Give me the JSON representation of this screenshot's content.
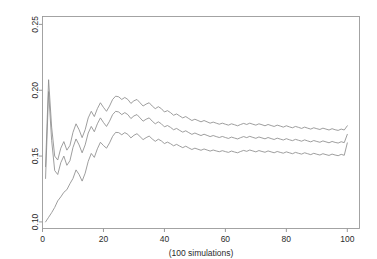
{
  "chart_data": {
    "type": "line",
    "title": "",
    "subtitle": "",
    "xlabel": "(100 simulations)",
    "ylabel": "",
    "xlim": [
      0,
      104
    ],
    "ylim": [
      0.095,
      0.256
    ],
    "xticks": [
      0,
      20,
      40,
      60,
      80,
      100
    ],
    "xtick_labels": [
      "0",
      "20",
      "40",
      "60",
      "80",
      "100"
    ],
    "yticks": [
      0.1,
      0.15,
      0.2,
      0.25
    ],
    "ytick_labels": [
      "0.10",
      "0.15",
      "0.20",
      "0.25"
    ],
    "ytick_rotation_deg": 90,
    "grid": false,
    "legend": "none",
    "line_color": "#8c8c8c",
    "frame_color": "#9a9a9a",
    "x": [
      1,
      2,
      3,
      4,
      5,
      6,
      7,
      8,
      9,
      10,
      11,
      12,
      13,
      14,
      15,
      16,
      17,
      18,
      19,
      20,
      21,
      22,
      23,
      24,
      25,
      26,
      27,
      28,
      29,
      30,
      31,
      32,
      33,
      34,
      35,
      36,
      37,
      38,
      39,
      40,
      41,
      42,
      43,
      44,
      45,
      46,
      47,
      48,
      49,
      50,
      51,
      52,
      53,
      54,
      55,
      56,
      57,
      58,
      59,
      60,
      61,
      62,
      63,
      64,
      65,
      66,
      67,
      68,
      69,
      70,
      71,
      72,
      73,
      74,
      75,
      76,
      77,
      78,
      79,
      80,
      81,
      82,
      83,
      84,
      85,
      86,
      87,
      88,
      89,
      90,
      91,
      92,
      93,
      94,
      95,
      96,
      97,
      98,
      99,
      100
    ],
    "series": [
      {
        "name": "upper confidence bound",
        "values": [
          0.142,
          0.208,
          0.172,
          0.15,
          0.147,
          0.156,
          0.161,
          0.1545,
          0.158,
          0.168,
          0.1745,
          0.17,
          0.164,
          0.17,
          0.179,
          0.184,
          0.18,
          0.186,
          0.1905,
          0.187,
          0.184,
          0.188,
          0.193,
          0.1955,
          0.195,
          0.193,
          0.1945,
          0.193,
          0.19,
          0.192,
          0.193,
          0.1905,
          0.188,
          0.1895,
          0.1905,
          0.188,
          0.186,
          0.1875,
          0.186,
          0.1835,
          0.1845,
          0.183,
          0.181,
          0.182,
          0.1805,
          0.179,
          0.18,
          0.1785,
          0.177,
          0.178,
          0.177,
          0.176,
          0.177,
          0.176,
          0.175,
          0.1758,
          0.175,
          0.1742,
          0.175,
          0.1742,
          0.1735,
          0.1745,
          0.1738,
          0.173,
          0.174,
          0.1748,
          0.174,
          0.175,
          0.1742,
          0.1735,
          0.1745,
          0.1738,
          0.173,
          0.174,
          0.1732,
          0.1725,
          0.1735,
          0.1728,
          0.172,
          0.173,
          0.1722,
          0.1715,
          0.1725,
          0.1718,
          0.171,
          0.172,
          0.1712,
          0.1705,
          0.1715,
          0.1708,
          0.1702,
          0.1712,
          0.1705,
          0.1698,
          0.1708,
          0.17,
          0.1695,
          0.1705,
          0.1698,
          0.173
        ]
      },
      {
        "name": "mean",
        "values": [
          0.133,
          0.199,
          0.162,
          0.139,
          0.136,
          0.145,
          0.15,
          0.143,
          0.1465,
          0.1565,
          0.163,
          0.1585,
          0.1525,
          0.1585,
          0.1675,
          0.1725,
          0.1685,
          0.1745,
          0.179,
          0.1755,
          0.1725,
          0.1765,
          0.1815,
          0.184,
          0.1835,
          0.1815,
          0.183,
          0.1815,
          0.1785,
          0.1805,
          0.1815,
          0.179,
          0.1765,
          0.178,
          0.179,
          0.1765,
          0.1745,
          0.176,
          0.1745,
          0.1722,
          0.1732,
          0.1718,
          0.17,
          0.171,
          0.1695,
          0.1682,
          0.1692,
          0.1678,
          0.1665,
          0.1675,
          0.1665,
          0.1656,
          0.1666,
          0.1657,
          0.1648,
          0.1656,
          0.1648,
          0.1641,
          0.1649,
          0.1641,
          0.1634,
          0.1644,
          0.1637,
          0.163,
          0.164,
          0.1648,
          0.164,
          0.165,
          0.1642,
          0.1635,
          0.1645,
          0.1638,
          0.1631,
          0.1641,
          0.1633,
          0.1626,
          0.1636,
          0.1629,
          0.1622,
          0.1632,
          0.1624,
          0.1617,
          0.1627,
          0.162,
          0.1613,
          0.1623,
          0.1615,
          0.1608,
          0.1618,
          0.1611,
          0.1605,
          0.1615,
          0.1608,
          0.1601,
          0.1611,
          0.1604,
          0.1599,
          0.1609,
          0.1602,
          0.1665
        ]
      },
      {
        "name": "lower confidence bound",
        "values": [
          0.1,
          0.1035,
          0.107,
          0.111,
          0.116,
          0.119,
          0.1225,
          0.1245,
          0.129,
          0.133,
          0.1395,
          0.136,
          0.131,
          0.137,
          0.146,
          0.152,
          0.149,
          0.1555,
          0.1605,
          0.158,
          0.156,
          0.16,
          0.165,
          0.168,
          0.1678,
          0.1662,
          0.1678,
          0.1665,
          0.1638,
          0.1658,
          0.167,
          0.1648,
          0.1625,
          0.164,
          0.1652,
          0.163,
          0.1612,
          0.1628,
          0.1615,
          0.1595,
          0.1606,
          0.1594,
          0.1578,
          0.1589,
          0.1576,
          0.1564,
          0.1575,
          0.1562,
          0.155,
          0.156,
          0.1552,
          0.1544,
          0.1554,
          0.1546,
          0.1538,
          0.1546,
          0.1539,
          0.1533,
          0.1541,
          0.1534,
          0.1528,
          0.1538,
          0.1531,
          0.1525,
          0.1535,
          0.1543,
          0.1536,
          0.1546,
          0.1539,
          0.1532,
          0.1542,
          0.1535,
          0.1529,
          0.1539,
          0.1532,
          0.1525,
          0.1535,
          0.1528,
          0.1522,
          0.1532,
          0.1525,
          0.1518,
          0.1528,
          0.1521,
          0.1515,
          0.1525,
          0.1518,
          0.1511,
          0.1521,
          0.1514,
          0.1508,
          0.1518,
          0.1511,
          0.1505,
          0.1515,
          0.1508,
          0.1503,
          0.1513,
          0.1506,
          0.16
        ]
      }
    ]
  }
}
